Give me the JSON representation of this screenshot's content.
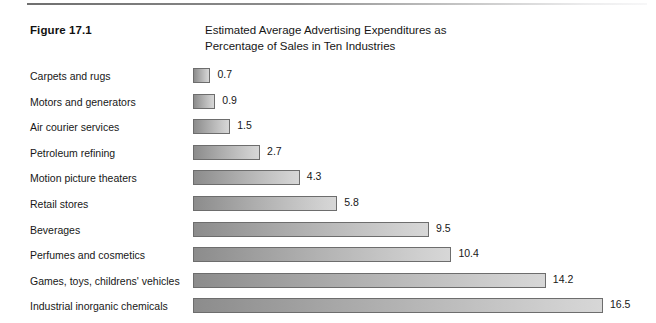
{
  "figure": {
    "number_label": "Figure 17.1",
    "title_line1": "Estimated Average Advertising Expenditures as",
    "title_line2": "Percentage of Sales in Ten Industries"
  },
  "chart_data": {
    "type": "bar",
    "orientation": "horizontal",
    "title": "Estimated Average Advertising Expenditures as Percentage of Sales in Ten Industries",
    "xlabel": "",
    "ylabel": "",
    "xlim": [
      0,
      16.5
    ],
    "grid": false,
    "legend": "none",
    "value_labels": true,
    "categories": [
      "Carpets and rugs",
      "Motors and generators",
      "Air courier services",
      "Petroleum refining",
      "Motion picture theaters",
      "Retail stores",
      "Beverages",
      "Perfumes and cosmetics",
      "Games, toys, childrens' vehicles",
      "Industrial inorganic chemicals"
    ],
    "values": [
      0.7,
      0.9,
      1.5,
      2.7,
      4.3,
      5.8,
      9.5,
      10.4,
      14.2,
      16.5
    ],
    "value_text": [
      "0.7",
      "0.9",
      "1.5",
      "2.7",
      "4.3",
      "5.8",
      "9.5",
      "10.4",
      "14.2",
      "16.5"
    ],
    "units": "percent of sales",
    "bar_gradient_start": "#8c8c8c",
    "bar_gradient_end": "#d7d7d7",
    "bar_border_color": "#6d6d6d"
  }
}
